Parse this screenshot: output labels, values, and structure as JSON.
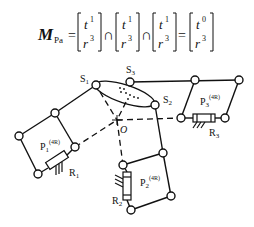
{
  "formula": {
    "lhs_symbol": "M",
    "lhs_subscript": "Pa",
    "equals": "=",
    "intersect": "∩",
    "matrices": [
      {
        "top_base": "t",
        "top_exp": "1",
        "bottom_base": "r",
        "bottom_exp": "3"
      },
      {
        "top_base": "t",
        "top_exp": "1",
        "bottom_base": "r",
        "bottom_exp": "3"
      },
      {
        "top_base": "t",
        "top_exp": "1",
        "bottom_base": "r",
        "bottom_exp": "3"
      }
    ],
    "result": {
      "top_base": "t",
      "top_exp": "0",
      "bottom_base": "r",
      "bottom_exp": "3"
    }
  },
  "diagram": {
    "labels": {
      "s1": {
        "base": "S",
        "sub": "1"
      },
      "s2": {
        "base": "S",
        "sub": "2"
      },
      "s3": {
        "base": "S",
        "sub": "3"
      },
      "origin": "O",
      "p1": {
        "base": "P",
        "sub": "1",
        "sup": "(4R)"
      },
      "p2": {
        "base": "P",
        "sub": "2",
        "sup": "(4R)"
      },
      "p3": {
        "base": "P",
        "sub": "3",
        "sup": "(4R)"
      },
      "r1": {
        "base": "R",
        "sub": "1"
      },
      "r2": {
        "base": "R",
        "sub": "2"
      },
      "r3": {
        "base": "R",
        "sub": "3"
      }
    },
    "colors": {
      "stroke": "#111111",
      "background": "#ffffff"
    }
  }
}
